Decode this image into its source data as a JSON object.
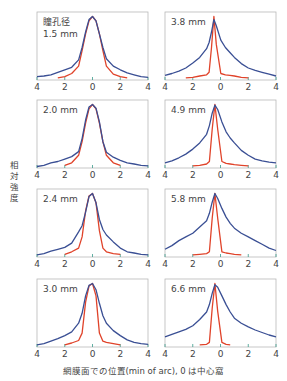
{
  "chart_data": {
    "type": "line",
    "title": "",
    "xlabel": "網膜面での位置(min of arc), 0 は中心窩",
    "ylabel": "相対強度",
    "xlim": [
      -4,
      4
    ],
    "ylim": [
      0,
      1
    ],
    "x_ticks": [
      4,
      2,
      0,
      2,
      4
    ],
    "grid": false,
    "legend": null,
    "series_colors": {
      "measured": "#3a4f94",
      "diffraction_limit": "#e0432a"
    },
    "x": [
      -4,
      -3.5,
      -3,
      -2.5,
      -2,
      -1.5,
      -1,
      -0.75,
      -0.5,
      -0.25,
      0,
      0.25,
      0.5,
      0.75,
      1,
      1.5,
      2,
      2.5,
      3,
      3.5,
      4
    ],
    "panels": [
      {
        "label": "瞳孔径\n1.5 mm",
        "label_line1": "瞳孔径",
        "label_line2": "1.5 mm",
        "peak_x": 0,
        "series": [
          {
            "name": "measured",
            "values": [
              0.03,
              0.04,
              0.06,
              0.1,
              0.14,
              0.18,
              0.3,
              0.5,
              0.75,
              0.95,
              1.0,
              0.93,
              0.72,
              0.5,
              0.32,
              0.2,
              0.14,
              0.09,
              0.06,
              0.03,
              0.02
            ]
          },
          {
            "name": "diffraction_limit",
            "values": [
              null,
              null,
              null,
              0.01,
              0.03,
              0.08,
              0.2,
              0.45,
              0.72,
              0.93,
              1.0,
              0.93,
              0.72,
              0.45,
              0.2,
              0.07,
              0.03,
              0.01,
              null,
              null,
              null
            ]
          }
        ]
      },
      {
        "label": "3.8 mm",
        "label_line1": "3.8 mm",
        "label_line2": "",
        "peak_x": -0.3,
        "series": [
          {
            "name": "measured",
            "values": [
              0.05,
              0.08,
              0.12,
              0.17,
              0.25,
              0.34,
              0.48,
              0.58,
              0.75,
              0.95,
              0.85,
              0.62,
              0.5,
              0.42,
              0.34,
              0.24,
              0.17,
              0.13,
              0.1,
              0.07,
              0.04
            ]
          },
          {
            "name": "diffraction_limit",
            "values": [
              null,
              null,
              null,
              0.01,
              0.02,
              0.04,
              0.06,
              0.1,
              0.5,
              1.0,
              0.55,
              0.08,
              0.06,
              0.05,
              0.04,
              0.02,
              0.01,
              null,
              null,
              null,
              null
            ]
          }
        ]
      },
      {
        "label": "2.0 mm",
        "label_line1": "2.0 mm",
        "label_line2": "",
        "peak_x": 0,
        "series": [
          {
            "name": "measured",
            "values": [
              0.0,
              0.02,
              0.06,
              0.08,
              0.12,
              0.16,
              0.24,
              0.45,
              0.75,
              0.96,
              1.0,
              0.94,
              0.72,
              0.4,
              0.23,
              0.15,
              0.1,
              0.06,
              0.04,
              0.02,
              0.01
            ]
          },
          {
            "name": "diffraction_limit",
            "values": [
              null,
              null,
              null,
              null,
              0.02,
              0.06,
              0.18,
              0.4,
              0.7,
              0.93,
              1.0,
              0.93,
              0.7,
              0.4,
              0.18,
              0.06,
              0.02,
              null,
              null,
              null,
              null
            ]
          }
        ]
      },
      {
        "label": "4.9 mm",
        "label_line1": "4.9 mm",
        "label_line2": "",
        "peak_x": -0.2,
        "series": [
          {
            "name": "measured",
            "values": [
              0.06,
              0.09,
              0.14,
              0.2,
              0.28,
              0.38,
              0.52,
              0.66,
              0.86,
              0.99,
              0.92,
              0.72,
              0.56,
              0.46,
              0.38,
              0.26,
              0.18,
              0.12,
              0.09,
              0.07,
              0.06
            ]
          },
          {
            "name": "diffraction_limit",
            "values": [
              null,
              null,
              null,
              null,
              0.01,
              0.02,
              0.04,
              0.08,
              0.6,
              1.0,
              0.6,
              0.08,
              0.05,
              0.04,
              0.03,
              0.02,
              0.01,
              null,
              null,
              null,
              null
            ]
          }
        ]
      },
      {
        "label": "2.4 mm",
        "label_line1": "2.4 mm",
        "label_line2": "",
        "peak_x": 0,
        "series": [
          {
            "name": "measured",
            "values": [
              0.01,
              0.03,
              0.07,
              0.1,
              0.13,
              0.2,
              0.38,
              0.48,
              0.7,
              0.95,
              1.0,
              0.85,
              0.58,
              0.42,
              0.33,
              0.22,
              0.12,
              0.06,
              0.04,
              0.02,
              0.01
            ]
          },
          {
            "name": "diffraction_limit",
            "values": [
              null,
              null,
              null,
              null,
              0.02,
              0.06,
              0.12,
              0.3,
              0.72,
              0.96,
              1.0,
              0.85,
              0.4,
              0.12,
              0.06,
              0.03,
              0.02,
              null,
              null,
              null,
              null
            ]
          }
        ]
      },
      {
        "label": "5.8 mm",
        "label_line1": "5.8 mm",
        "label_line2": "",
        "peak_x": -0.2,
        "series": [
          {
            "name": "measured",
            "values": [
              0.1,
              0.16,
              0.24,
              0.3,
              0.36,
              0.46,
              0.56,
              0.68,
              0.86,
              1.0,
              0.92,
              0.76,
              0.62,
              0.52,
              0.44,
              0.36,
              0.3,
              0.24,
              0.18,
              0.12,
              0.08
            ]
          },
          {
            "name": "diffraction_limit",
            "values": [
              null,
              null,
              null,
              null,
              0.01,
              0.02,
              0.03,
              0.06,
              0.6,
              1.0,
              0.6,
              0.06,
              0.04,
              0.03,
              0.02,
              0.01,
              null,
              null,
              null,
              null,
              null
            ]
          }
        ]
      },
      {
        "label": "3.0 mm",
        "label_line1": "3.0 mm",
        "label_line2": "",
        "peak_x": 0,
        "series": [
          {
            "name": "measured",
            "values": [
              0.01,
              0.03,
              0.07,
              0.11,
              0.16,
              0.22,
              0.36,
              0.52,
              0.8,
              0.97,
              1.0,
              0.9,
              0.68,
              0.48,
              0.36,
              0.24,
              0.16,
              0.09,
              0.05,
              0.03,
              0.02
            ]
          },
          {
            "name": "diffraction_limit",
            "values": [
              null,
              null,
              null,
              null,
              0.01,
              0.04,
              0.08,
              0.2,
              0.7,
              0.96,
              1.0,
              0.8,
              0.2,
              0.07,
              0.05,
              0.03,
              0.01,
              null,
              null,
              null,
              null
            ]
          }
        ]
      },
      {
        "label": "6.6 mm",
        "label_line1": "6.6 mm",
        "label_line2": "",
        "peak_x": -0.2,
        "series": [
          {
            "name": "measured",
            "values": [
              0.14,
              0.18,
              0.22,
              0.26,
              0.32,
              0.42,
              0.54,
              0.66,
              0.84,
              0.98,
              0.94,
              0.8,
              0.66,
              0.54,
              0.44,
              0.36,
              0.3,
              0.25,
              0.21,
              0.17,
              0.14
            ]
          },
          {
            "name": "diffraction_limit",
            "values": [
              null,
              null,
              null,
              null,
              null,
              0.01,
              0.02,
              0.05,
              0.6,
              1.0,
              0.55,
              0.05,
              0.02,
              0.01,
              null,
              null,
              null,
              null,
              null,
              null,
              null
            ]
          }
        ]
      }
    ]
  }
}
